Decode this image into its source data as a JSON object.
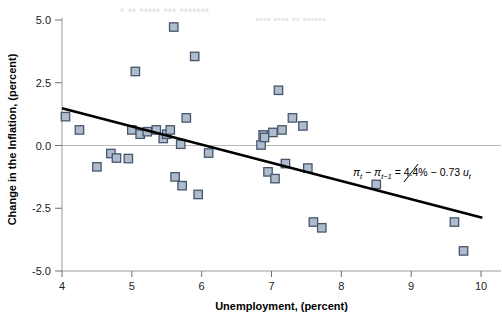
{
  "chart_data": {
    "type": "scatter",
    "title": "",
    "xlabel": "Unemployment, (percent)",
    "ylabel": "Change in the Inflation, (percent)",
    "xlim": [
      4,
      10
    ],
    "ylim": [
      -5.0,
      5.0
    ],
    "xticks": [
      4,
      5,
      6,
      7,
      8,
      9,
      10
    ],
    "xticklabels": [
      "4",
      "5",
      "6",
      "7",
      "8",
      "9",
      "10"
    ],
    "yticks": [
      -5.0,
      -2.5,
      0.0,
      2.5,
      5.0
    ],
    "yticklabels": [
      "-5.0",
      "-2.5",
      "0.0",
      "2.5",
      "5.0"
    ],
    "grid": false,
    "zero_line": true,
    "legend": "none",
    "marker": "square",
    "marker_face_color": "#aebccd",
    "marker_edge_color": "#47556b",
    "line_color": "#000000",
    "points": [
      {
        "x": 4.05,
        "y": 1.15
      },
      {
        "x": 4.25,
        "y": 0.62
      },
      {
        "x": 4.5,
        "y": -0.85
      },
      {
        "x": 4.7,
        "y": -0.32
      },
      {
        "x": 4.78,
        "y": -0.5
      },
      {
        "x": 4.95,
        "y": -0.52
      },
      {
        "x": 5.0,
        "y": 0.62
      },
      {
        "x": 5.05,
        "y": 2.95
      },
      {
        "x": 5.12,
        "y": 0.45
      },
      {
        "x": 5.22,
        "y": 0.55
      },
      {
        "x": 5.35,
        "y": 0.62
      },
      {
        "x": 5.45,
        "y": 0.28
      },
      {
        "x": 5.5,
        "y": 0.45
      },
      {
        "x": 5.55,
        "y": 0.62
      },
      {
        "x": 5.6,
        "y": 4.72
      },
      {
        "x": 5.62,
        "y": -1.25
      },
      {
        "x": 5.7,
        "y": 0.05
      },
      {
        "x": 5.72,
        "y": -1.6
      },
      {
        "x": 5.78,
        "y": 1.1
      },
      {
        "x": 5.9,
        "y": 3.55
      },
      {
        "x": 5.95,
        "y": -1.95
      },
      {
        "x": 6.1,
        "y": -0.3
      },
      {
        "x": 6.85,
        "y": 0.02
      },
      {
        "x": 6.88,
        "y": 0.42
      },
      {
        "x": 6.9,
        "y": 0.32
      },
      {
        "x": 6.95,
        "y": -1.05
      },
      {
        "x": 7.02,
        "y": 0.52
      },
      {
        "x": 7.05,
        "y": -1.32
      },
      {
        "x": 7.1,
        "y": 2.2
      },
      {
        "x": 7.15,
        "y": 0.62
      },
      {
        "x": 7.2,
        "y": -0.72
      },
      {
        "x": 7.3,
        "y": 1.1
      },
      {
        "x": 7.45,
        "y": 0.78
      },
      {
        "x": 7.52,
        "y": -0.9
      },
      {
        "x": 7.6,
        "y": -3.05
      },
      {
        "x": 7.72,
        "y": -3.28
      },
      {
        "x": 8.5,
        "y": -1.55
      },
      {
        "x": 9.62,
        "y": -3.05
      },
      {
        "x": 9.75,
        "y": -4.2
      }
    ],
    "fit_line": {
      "x_start": 4.0,
      "y_start": 1.48,
      "x_end": 10.02,
      "y_end": -2.88,
      "equation": "πt − πt−1 = 4.4% − 0.73 ut",
      "intercept_label": "4.4%",
      "slope_label": "0.73"
    },
    "equation_parts": {
      "pi_symbol": "π",
      "sub_t": "t",
      "sub_t_minus_1": "t−1",
      "minus": "−",
      "equals": "=",
      "intercept": "4.4%",
      "slope": "0.73",
      "u_symbol": "u"
    }
  },
  "bleed_through": [
    {
      "text": "• •• ••••• ••• •••••••",
      "x": 120,
      "y": 2,
      "size": 12
    },
    {
      "text": "•••• •••• •• ••••••",
      "x": 255,
      "y": 12,
      "size": 11
    }
  ]
}
